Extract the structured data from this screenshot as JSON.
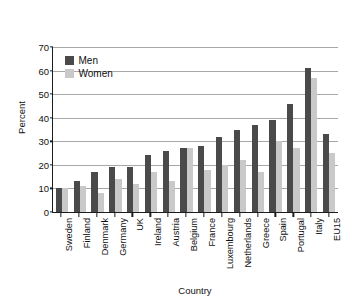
{
  "top_fragment": "",
  "chart_data": {
    "type": "bar",
    "title": "",
    "xlabel": "Country",
    "ylabel": "Percent",
    "ylim": [
      0,
      70
    ],
    "yticks": [
      0,
      10,
      20,
      30,
      40,
      50,
      60,
      70
    ],
    "grid": true,
    "legend_position": "top-left-inside",
    "categories": [
      "Sweden",
      "Finland",
      "Denmark",
      "Germany",
      "UK",
      "Ireland",
      "Austria",
      "Belgium",
      "France",
      "Luxembourg",
      "Netherlands",
      "Greece",
      "Spain",
      "Portugal",
      "Italy",
      "EU15"
    ],
    "series": [
      {
        "name": "Men",
        "color": "#4a4a4a",
        "values": [
          10,
          13,
          17,
          19,
          19,
          24,
          26,
          27,
          28,
          32,
          35,
          37,
          39,
          46,
          61,
          33
        ]
      },
      {
        "name": "Women",
        "color": "#c9c9c9",
        "values": [
          10,
          11,
          8,
          14,
          12,
          17,
          13,
          27,
          18,
          20,
          22,
          17,
          30,
          27,
          57,
          25
        ]
      }
    ]
  }
}
